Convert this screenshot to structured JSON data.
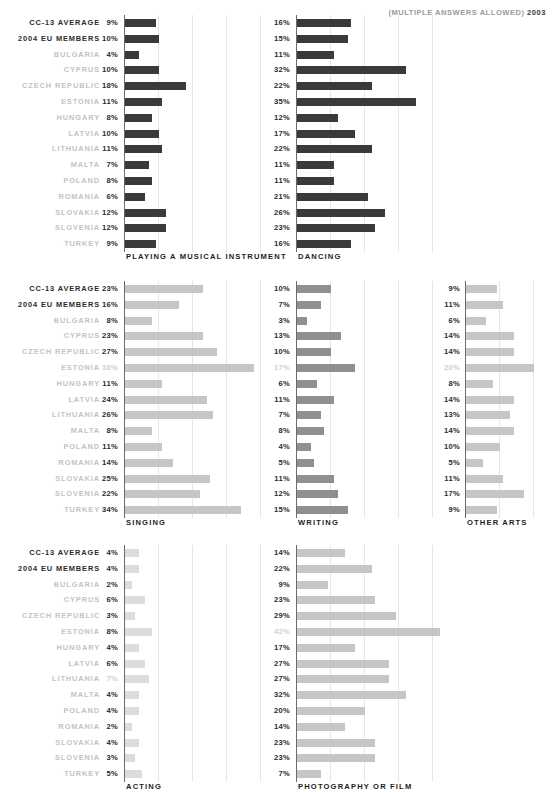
{
  "header": {
    "note": "(MULTIPLE ANSWERS ALLOWED)",
    "year": "2003"
  },
  "categories": [
    "CC-13 AVERAGE",
    "2004 EU MEMBERS",
    "BULGARIA",
    "CYPRUS",
    "CZECH REPUBLIC",
    "ESTONIA",
    "HUNGARY",
    "LATVIA",
    "LITHUANIA",
    "MALTA",
    "POLAND",
    "ROMANIA",
    "SLOVAKIA",
    "SLOVENIA",
    "TURKEY"
  ],
  "label_emphasis": [
    "strong",
    "strong",
    "light",
    "light",
    "light",
    "light",
    "light",
    "light",
    "light",
    "light",
    "light",
    "light",
    "light",
    "light",
    "light"
  ],
  "colors": {
    "bar_dark": "#3a3a3a",
    "bar_mid": "#8f8f8f",
    "bar_light": "#c6c6c6",
    "bar_pale": "#dcdcdc",
    "gridline": "#e6e6e6",
    "axis": "#6b6b6b",
    "label_strong": "#2b2b2b",
    "label_light": "#c3c3c3",
    "value_faded": "#cfcfcf"
  },
  "chart_data": {
    "type": "bar",
    "subtitle": "(MULTIPLE ANSWERS ALLOWED) 2003",
    "xlabel": "",
    "ylabel": "",
    "unit": "%",
    "grid": true,
    "legend_position": "none",
    "orientation": "horizontal",
    "categories": [
      "CC-13 AVERAGE",
      "2004 EU MEMBERS",
      "BULGARIA",
      "CYPRUS",
      "CZECH REPUBLIC",
      "ESTONIA",
      "HUNGARY",
      "LATVIA",
      "LITHUANIA",
      "MALTA",
      "POLAND",
      "ROMANIA",
      "SLOVAKIA",
      "SLOVENIA",
      "TURKEY"
    ],
    "series": [
      {
        "name": "PLAYING A MUSICAL INSTRUMENT",
        "values": [
          9,
          10,
          4,
          10,
          18,
          11,
          8,
          10,
          11,
          7,
          8,
          6,
          12,
          12,
          9
        ],
        "labels": [
          "9%",
          "10%",
          "4%",
          "10%",
          "18%",
          "11%",
          "8%",
          "10%",
          "11%",
          "7%",
          "8%",
          "6%",
          "12%",
          "12%",
          "9%"
        ],
        "faded_labels": [],
        "color": "#3a3a3a",
        "xlim": [
          0,
          45
        ]
      },
      {
        "name": "DANCING",
        "values": [
          16,
          15,
          11,
          32,
          22,
          35,
          12,
          17,
          22,
          11,
          11,
          21,
          26,
          23,
          16
        ],
        "labels": [
          "16%",
          "15%",
          "11%",
          "32%",
          "22%",
          "35%",
          "12%",
          "17%",
          "22%",
          "11%",
          "11%",
          "21%",
          "26%",
          "23%",
          "16%"
        ],
        "faded_labels": [],
        "color": "#3a3a3a",
        "xlim": [
          0,
          45
        ]
      },
      {
        "name": "SINGING",
        "values": [
          23,
          16,
          8,
          23,
          27,
          38,
          11,
          24,
          26,
          8,
          11,
          14,
          25,
          22,
          34
        ],
        "labels": [
          "23%",
          "16%",
          "8%",
          "23%",
          "27%",
          "38%",
          "11%",
          "24%",
          "26%",
          "8%",
          "11%",
          "14%",
          "25%",
          "22%",
          "34%"
        ],
        "faded_labels": [
          "ESTONIA"
        ],
        "color": "#c6c6c6",
        "xlim": [
          0,
          45
        ]
      },
      {
        "name": "WRITING",
        "values": [
          10,
          7,
          3,
          13,
          10,
          17,
          6,
          11,
          7,
          8,
          4,
          5,
          11,
          12,
          15
        ],
        "labels": [
          "10%",
          "7%",
          "3%",
          "13%",
          "10%",
          "17%",
          "6%",
          "11%",
          "7%",
          "8%",
          "4%",
          "5%",
          "11%",
          "12%",
          "15%"
        ],
        "faded_labels": [
          "ESTONIA"
        ],
        "color": "#8f8f8f",
        "xlim": [
          0,
          45
        ]
      },
      {
        "name": "OTHER ARTS",
        "values": [
          9,
          11,
          6,
          14,
          14,
          20,
          8,
          14,
          13,
          14,
          10,
          5,
          11,
          17,
          9
        ],
        "labels": [
          "9%",
          "11%",
          "6%",
          "14%",
          "14%",
          "20%",
          "8%",
          "14%",
          "13%",
          "14%",
          "10%",
          "5%",
          "11%",
          "17%",
          "9%"
        ],
        "faded_labels": [
          "ESTONIA"
        ],
        "color": "#c6c6c6",
        "xlim": [
          0,
          25
        ]
      },
      {
        "name": "ACTING",
        "values": [
          4,
          4,
          2,
          6,
          3,
          8,
          4,
          6,
          7,
          4,
          4,
          2,
          4,
          3,
          5
        ],
        "labels": [
          "4%",
          "4%",
          "2%",
          "6%",
          "3%",
          "8%",
          "4%",
          "6%",
          "7%",
          "4%",
          "4%",
          "2%",
          "4%",
          "3%",
          "5%"
        ],
        "faded_labels": [
          "LITHUANIA"
        ],
        "color": "#dcdcdc",
        "xlim": [
          0,
          45
        ]
      },
      {
        "name": "PHOTOGRAPHY OR FILM",
        "values": [
          14,
          22,
          9,
          23,
          29,
          42,
          17,
          27,
          27,
          32,
          20,
          14,
          23,
          23,
          7
        ],
        "labels": [
          "14%",
          "22%",
          "9%",
          "23%",
          "29%",
          "42%",
          "17%",
          "27%",
          "27%",
          "32%",
          "20%",
          "14%",
          "23%",
          "23%",
          "7%"
        ],
        "faded_labels": [
          "ESTONIA"
        ],
        "color": "#c6c6c6",
        "xlim": [
          0,
          45
        ]
      }
    ]
  },
  "blocks": [
    {
      "id": "block-1",
      "top": 15,
      "show_labels": true,
      "title_y": 252,
      "panels": [
        {
          "series_index": 0,
          "value_x": 60,
          "value_w": 58,
          "axis_x": 124,
          "plot_w": 160,
          "px_per_unit": 3.4,
          "gridlines": [
            10,
            20,
            30,
            40
          ]
        },
        {
          "series_index": 1,
          "value_x": 232,
          "value_w": 58,
          "axis_x": 296,
          "plot_w": 250,
          "px_per_unit": 3.4,
          "gridlines": [
            10,
            20,
            30,
            40
          ]
        }
      ]
    },
    {
      "id": "block-2",
      "top": 281,
      "show_labels": true,
      "title_y": 518,
      "panels": [
        {
          "series_index": 2,
          "value_x": 60,
          "value_w": 58,
          "axis_x": 124,
          "plot_w": 160,
          "px_per_unit": 3.4,
          "gridlines": [
            10,
            20,
            30,
            40
          ]
        },
        {
          "series_index": 3,
          "value_x": 232,
          "value_w": 58,
          "axis_x": 296,
          "plot_w": 148,
          "px_per_unit": 3.4,
          "gridlines": [
            10,
            20,
            30,
            40
          ]
        },
        {
          "series_index": 4,
          "value_x": 404,
          "value_w": 56,
          "axis_x": 465,
          "plot_w": 85,
          "px_per_unit": 3.4,
          "gridlines": [
            10,
            20
          ]
        }
      ]
    },
    {
      "id": "block-3",
      "top": 545,
      "show_labels": true,
      "title_y": 782,
      "panels": [
        {
          "series_index": 5,
          "value_x": 60,
          "value_w": 58,
          "axis_x": 124,
          "plot_w": 160,
          "px_per_unit": 3.4,
          "gridlines": [
            10,
            20,
            30,
            40
          ]
        },
        {
          "series_index": 6,
          "value_x": 232,
          "value_w": 58,
          "axis_x": 296,
          "plot_w": 250,
          "px_per_unit": 3.4,
          "gridlines": [
            10,
            20,
            30,
            40
          ]
        }
      ]
    }
  ]
}
